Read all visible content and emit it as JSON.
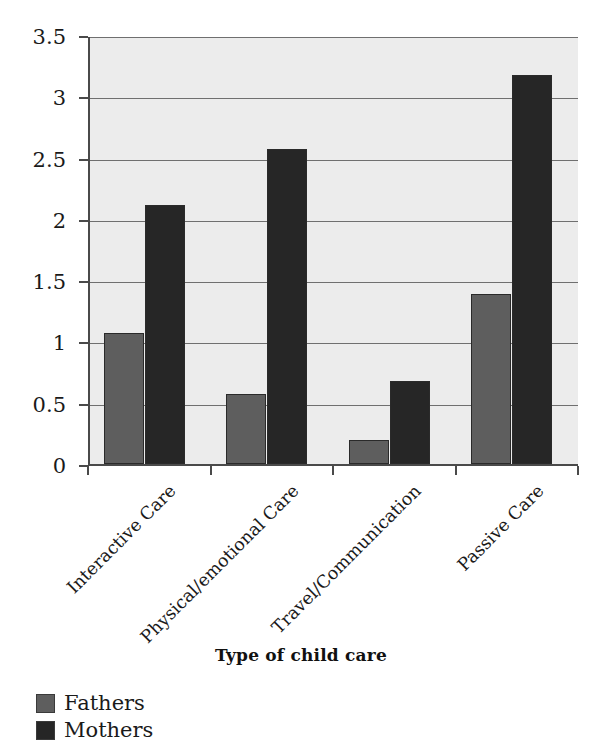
{
  "chart_data": {
    "type": "bar",
    "title": "",
    "xlabel": "Type of child care",
    "ylabel": "",
    "ylim": [
      0,
      3.5
    ],
    "ytick_values": [
      0,
      0.5,
      1,
      1.5,
      2,
      2.5,
      3,
      3.5
    ],
    "ytick_labels": [
      "0",
      "0.5",
      "1",
      "1.5",
      "2",
      "2.5",
      "3",
      "3.5"
    ],
    "categories": [
      "Interactive Care",
      "Physical/emotional Care",
      "Travel/Communication",
      "Passive Care"
    ],
    "series": [
      {
        "name": "Fathers",
        "color": "#5e5e5e",
        "values": [
          1.07,
          0.57,
          0.2,
          1.39
        ]
      },
      {
        "name": "Mothers",
        "color": "#262626",
        "values": [
          2.11,
          2.57,
          0.68,
          3.17
        ]
      }
    ],
    "grid": true,
    "legend_position": "bottom-left",
    "plot_background": "#ececec",
    "axis_color": "#4a4a4a"
  },
  "legend": {
    "items": [
      {
        "label": "Fathers",
        "color": "#5e5e5e"
      },
      {
        "label": "Mothers",
        "color": "#262626"
      }
    ]
  },
  "axis_title": "Type of child care"
}
